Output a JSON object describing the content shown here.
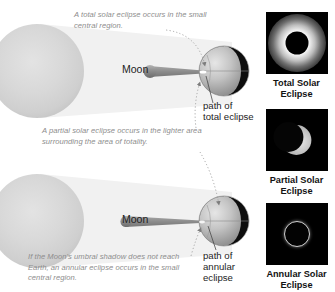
{
  "figure": {
    "background_color": "#ffffff"
  },
  "colors": {
    "caption_text": "#8d8d8d",
    "label_text": "#1d1d1d",
    "photo_label_text": "#131313",
    "photo_background": "#000000",
    "sun_fill": "#d6d6d6",
    "penumbra_fill": "#f0f0f0",
    "umbra_fill": "#9a9a9a",
    "earth_lit": "#c9c9c9",
    "earth_dark": "#0a0a0a",
    "moon_fill": "#8f8f8f",
    "leader_line": "#9a9a9a"
  },
  "top_diagram": {
    "name": "total-solar-eclipse-diagram",
    "sun_label": "",
    "moon_label": "Moon",
    "caption_total": "A total solar eclipse occurs in the small\ncentral region.",
    "caption_partial": "A partial solar eclipse occurs in the lighter area\nsurrounding the area of totality.",
    "path_label": "path of\ntotal eclipse"
  },
  "bottom_diagram": {
    "name": "annular-solar-eclipse-diagram",
    "moon_label": "Moon",
    "caption_annular": "If the Moon's umbral shadow does not reach\nEarth, an annular eclipse occurs in the small\ncentral region.",
    "path_label": "path of\nannular\neclipse"
  },
  "photos": [
    {
      "id": "total",
      "caption": "Total Solar\nEclipse",
      "description": "black lunar disk surrounded by white corona"
    },
    {
      "id": "partial",
      "caption": "Partial Solar\nEclipse",
      "description": "crescent of the Sun on a black sky"
    },
    {
      "id": "annular",
      "caption": "Annular Solar\nEclipse",
      "description": "thin bright ring of fire on a black sky"
    }
  ]
}
